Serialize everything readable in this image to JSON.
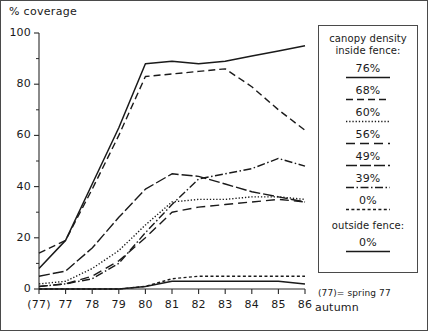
{
  "figure": {
    "yaxis_title": "% coverage",
    "xaxis_label": "autumn",
    "footnote": "(77)= spring 77"
  },
  "legend": {
    "title_line1": "canopy density",
    "title_line2": "inside fence:",
    "outside_title": "outside fence:",
    "entries": [
      {
        "label": "76%",
        "style": "solid"
      },
      {
        "label": "68%",
        "style": "dashed-medium"
      },
      {
        "label": "60%",
        "style": "dotted"
      },
      {
        "label": "56%",
        "style": "dashed-long"
      },
      {
        "label": "49%",
        "style": "dash-long-gap"
      },
      {
        "label": "39%",
        "style": "dash-dot"
      },
      {
        "label": "0%",
        "style": "dashed-wide"
      }
    ],
    "outside_entries": [
      {
        "label": "0%",
        "style": "solid"
      }
    ]
  },
  "chart_data": {
    "type": "line",
    "title": "",
    "xlabel": "autumn",
    "ylabel": "% coverage",
    "xlim": [
      0,
      10
    ],
    "ylim": [
      0,
      100
    ],
    "grid": false,
    "legend_position": "right",
    "categories": [
      "(77)",
      "77",
      "78",
      "79",
      "80",
      "81",
      "82",
      "83",
      "84",
      "85",
      "86"
    ],
    "x": [
      0,
      1,
      2,
      3,
      4,
      5,
      6,
      7,
      8,
      9,
      10
    ],
    "yticks": [
      0,
      20,
      40,
      60,
      80,
      100
    ],
    "minor_yticks": [
      10,
      30,
      50,
      70,
      90
    ],
    "series": [
      {
        "name": "76%",
        "style": "solid",
        "values": [
          8,
          19,
          41,
          63,
          88,
          89,
          88,
          89,
          91,
          93,
          95
        ]
      },
      {
        "name": "68%",
        "style": "dashed-medium",
        "values": [
          14,
          19,
          39,
          60,
          83,
          84,
          85,
          86,
          79,
          70,
          62
        ]
      },
      {
        "name": "60%",
        "style": "dotted",
        "values": [
          2,
          3,
          8,
          15,
          25,
          34,
          35,
          35,
          36,
          36,
          35
        ]
      },
      {
        "name": "56%",
        "style": "dashed-long",
        "values": [
          1,
          2,
          5,
          11,
          20,
          30,
          32,
          33,
          34,
          35,
          34
        ]
      },
      {
        "name": "49%",
        "style": "dash-long-gap",
        "values": [
          5,
          7,
          16,
          28,
          39,
          45,
          44,
          41,
          38,
          36,
          34
        ]
      },
      {
        "name": "39%",
        "style": "dash-dot",
        "values": [
          1,
          2,
          4,
          10,
          22,
          33,
          43,
          45,
          47,
          51,
          48
        ]
      },
      {
        "name": "0% inside",
        "style": "dashed-wide",
        "values": [
          0,
          0,
          0,
          0,
          1,
          4,
          5,
          5,
          5,
          5,
          5
        ]
      },
      {
        "name": "0% outside",
        "style": "solid",
        "values": [
          0,
          0,
          0,
          0,
          1,
          3,
          3,
          3,
          3,
          3,
          2
        ]
      }
    ]
  }
}
